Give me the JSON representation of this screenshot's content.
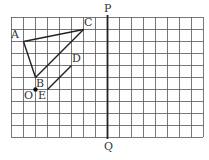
{
  "figure": {
    "grid": {
      "cols": 16,
      "rows": 10,
      "cell": 12,
      "origin_x": 11,
      "origin_y": 17,
      "line_color": "#555555"
    },
    "axis": {
      "col": 8,
      "top_label": "P",
      "bottom_label": "Q",
      "color": "#222222"
    },
    "points": [
      {
        "name": "A",
        "col": 1,
        "row": 2,
        "label_dx": -12,
        "label_dy": -12
      },
      {
        "name": "C",
        "col": 6,
        "row": 1,
        "label_dx": 1,
        "label_dy": -12
      },
      {
        "name": "B",
        "col": 2,
        "row": 5,
        "label_dx": 1,
        "label_dy": 1
      },
      {
        "name": "D",
        "col": 5,
        "row": 4,
        "label_dx": 1,
        "label_dy": -12
      },
      {
        "name": "E",
        "col": 3,
        "row": 6,
        "label_dx": -9,
        "label_dy": 1
      },
      {
        "name": "O",
        "col": 2,
        "row": 6,
        "label_dx": -11,
        "label_dy": 1
      }
    ],
    "segments": [
      [
        "A",
        "C"
      ],
      [
        "C",
        "B"
      ],
      [
        "B",
        "A"
      ],
      [
        "E",
        "D"
      ]
    ],
    "dot": "O",
    "labels": {
      "A": "A",
      "B": "B",
      "C": "C",
      "D": "D",
      "E": "E",
      "O": "O"
    }
  }
}
